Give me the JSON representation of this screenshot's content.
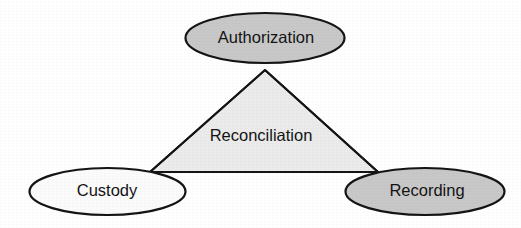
{
  "diagram": {
    "type": "venn-triangle-relationship",
    "background_color": "#ffffff",
    "stroke_color": "#141414",
    "center_region": {
      "label": "Reconciliation",
      "fill_color": "#ebebeb",
      "vertices": "apex(265,70) left(150,172) right(378,172)"
    },
    "nodes": [
      {
        "id": "authorization",
        "label": "Authorization",
        "fill_color": "#c8c8c8",
        "position": "top",
        "cx": 265,
        "cy": 38,
        "rx": 80,
        "ry": 25
      },
      {
        "id": "custody",
        "label": "Custody",
        "fill_color": "#fbfbfb",
        "position": "bottom-left",
        "cx": 107,
        "cy": 191,
        "rx": 78,
        "ry": 24
      },
      {
        "id": "recording",
        "label": "Recording",
        "fill_color": "#c8c8c8",
        "position": "bottom-right",
        "cx": 425,
        "cy": 191,
        "rx": 80,
        "ry": 24
      }
    ],
    "connectors": [
      {
        "id": "authorization-custody",
        "from": "authorization",
        "to": "custody"
      },
      {
        "id": "custody-recording",
        "from": "custody",
        "to": "recording"
      },
      {
        "id": "recording-authorization",
        "from": "recording",
        "to": "authorization"
      }
    ]
  }
}
